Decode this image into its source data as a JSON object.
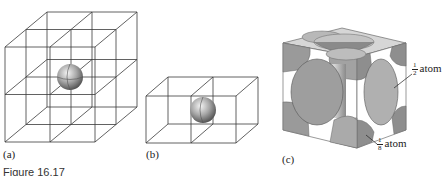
{
  "figure": {
    "caption": "Figure 16.17",
    "panels": [
      {
        "id": "a",
        "label": "(a)",
        "description": "3x3x3 stack of cubic unit cells (2x2x2 cells) with an atom at the shared central corner"
      },
      {
        "id": "b",
        "label": "(b)",
        "description": "Two adjacent cubic cells sharing a face with an atom at the shared edge"
      },
      {
        "id": "c",
        "label": "(c)",
        "description": "Face-centered cubic unit cell showing atom fractions"
      }
    ],
    "annotations": {
      "half_atom": {
        "numerator": "1",
        "denominator": "2",
        "text": "atom"
      },
      "eighth_atom": {
        "numerator": "1",
        "denominator": "8",
        "text": "atom"
      }
    },
    "colors": {
      "lines": "#3a3a3a",
      "atom_face": "#a9a9a9",
      "atom_shadow": "#7d7d7d",
      "cube_face": "#9c9c9c"
    }
  }
}
